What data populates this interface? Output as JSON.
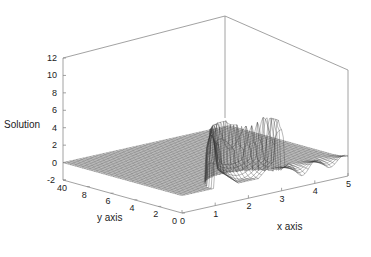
{
  "chart_data": {
    "type": "surface",
    "title": "",
    "xlabel": "x axis",
    "ylabel": "y axis",
    "zlabel": "Solution",
    "xlim": [
      0,
      5
    ],
    "ylim": [
      0,
      10
    ],
    "zlim": [
      -2,
      12
    ],
    "x_ticks": [
      "0",
      "1",
      "2",
      "3",
      "4",
      "5"
    ],
    "y_ticks": [
      "0",
      "2",
      "4",
      "6",
      "8",
      "40"
    ],
    "z_ticks": [
      "-2",
      "0",
      "2",
      "4",
      "6",
      "8",
      "10",
      "12"
    ],
    "grid": false,
    "style": "wireframe mesh, black lines on white, box frame",
    "features": [
      {
        "name": "ridge-peak-left",
        "x": 1.2,
        "y": 0.6,
        "z": 5.5
      },
      {
        "name": "ridge-peak-middle",
        "x": 2.0,
        "y": 1.0,
        "z": 5.2
      },
      {
        "name": "ridge-peak-right",
        "x": 2.7,
        "y": 0.8,
        "z": 6.0
      },
      {
        "name": "ripples",
        "x_range": [
          3,
          5
        ],
        "y": 0.2,
        "z_range": [
          -1,
          1
        ]
      }
    ]
  },
  "labels": {
    "zlabel": "Solution",
    "xlabel": "x axis",
    "ylabel": "y axis"
  }
}
